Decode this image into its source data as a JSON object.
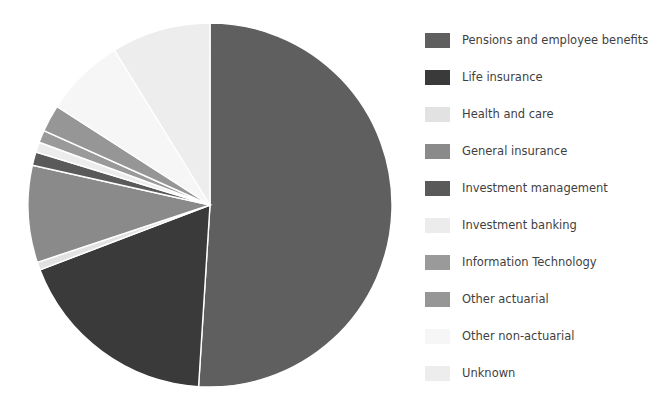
{
  "title_fragments": {
    "left": "",
    "right": ""
  },
  "chart_data": {
    "type": "pie",
    "title": "",
    "xlabel": "",
    "ylabel": "",
    "legend_position": "right",
    "grid": false,
    "start_angle_deg": 0,
    "direction": "clockwise",
    "categories": [
      "Pensions and employee benefits",
      "Life insurance",
      "Health and care",
      "General insurance",
      "Investment management",
      "Investment banking",
      "Information Technology",
      "Other actuarial",
      "Other non-actuarial",
      "Unknown"
    ],
    "values": [
      51.0,
      18.2,
      0.7,
      8.6,
      1.2,
      0.9,
      1.1,
      2.4,
      7.1,
      8.8
    ],
    "colors": [
      "#5f5f5f",
      "#3a3a3a",
      "#e2e2e2",
      "#8a8a8a",
      "#5a5a5a",
      "#ececec",
      "#9a9a9a",
      "#969696",
      "#f6f6f6",
      "#ededed"
    ]
  },
  "legend": {
    "items": [
      {
        "label": "Pensions and employee benefits",
        "color": "#5f5f5f"
      },
      {
        "label": "Life insurance",
        "color": "#3a3a3a"
      },
      {
        "label": "Health and care",
        "color": "#e2e2e2"
      },
      {
        "label": "General insurance",
        "color": "#8a8a8a"
      },
      {
        "label": "Investment management",
        "color": "#5a5a5a"
      },
      {
        "label": "Investment banking",
        "color": "#ececec"
      },
      {
        "label": "Information Technology",
        "color": "#9a9a9a"
      },
      {
        "label": "Other actuarial",
        "color": "#969696"
      },
      {
        "label": "Other non-actuarial",
        "color": "#f6f6f6"
      },
      {
        "label": "Unknown",
        "color": "#ededed"
      }
    ]
  }
}
